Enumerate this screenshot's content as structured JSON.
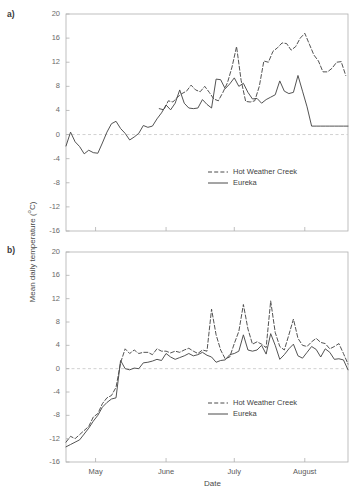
{
  "figure": {
    "panel_a_label": "a)",
    "panel_b_label": "b)",
    "y_axis_title_main": "Mean daily temperature (",
    "y_axis_title_sup": "o",
    "y_axis_title_tail": "C)",
    "y_axis_title_full": "Mean daily temperature (oC)",
    "x_axis_title": "Date"
  },
  "legend": {
    "series_1": "Hot Weather Creek",
    "series_2": "Eureka"
  },
  "colors": {
    "line": "#4a4a4a",
    "axis": "#b0b0b0",
    "zero_line": "#cccccc",
    "text": "#4a4a4a",
    "tick_text": "#6a6a6a",
    "background": "#ffffff"
  },
  "chart_data": [
    {
      "id": "panel-a",
      "type": "line",
      "title": "a)",
      "xlabel": "Date",
      "ylabel": "Mean daily temperature (oC)",
      "ylim": [
        -16,
        20
      ],
      "yticks": [
        20,
        16,
        12,
        8,
        4,
        0,
        -4,
        -8,
        -12,
        -16
      ],
      "ytick_labels": [
        "20",
        "16",
        "12",
        "8",
        "4",
        "0",
        "-4",
        "-8",
        "-12",
        "-16"
      ],
      "xlim": [
        0,
        124
      ],
      "xticks": [
        13,
        44,
        74,
        105
      ],
      "xtick_labels": [
        "",
        "",
        "",
        ""
      ],
      "grid": false,
      "zero_reference_line": 0,
      "legend_position": "lower-right",
      "series": [
        {
          "name": "Hot Weather Creek",
          "style": "dashed",
          "x": [
            41,
            43,
            45,
            47,
            49,
            51,
            53,
            55,
            57,
            59,
            61,
            63,
            65,
            67,
            69,
            71,
            73,
            75,
            77,
            79,
            81,
            83,
            85,
            87,
            89,
            91,
            93,
            95,
            97,
            99,
            101,
            103,
            105,
            107,
            109,
            111,
            113,
            115,
            117,
            119,
            121,
            123
          ],
          "values": [
            4.3,
            4.1,
            5.6,
            5.4,
            6.2,
            6.8,
            7.2,
            8.2,
            7.4,
            7.1,
            8.0,
            7.0,
            5.9,
            5.6,
            7.0,
            8.6,
            11.2,
            14.6,
            9.0,
            5.5,
            5.4,
            5.6,
            8.0,
            12.2,
            12.0,
            13.8,
            14.4,
            15.2,
            15.1,
            14.0,
            14.6,
            16.0,
            16.8,
            15.0,
            13.2,
            12.2,
            10.4,
            10.4,
            11.0,
            12.0,
            12.1,
            9.8,
            3.4
          ]
        },
        {
          "name": "Eureka",
          "style": "solid",
          "x": [
            0,
            2,
            4,
            6,
            8,
            10,
            12,
            14,
            16,
            18,
            20,
            22,
            24,
            26,
            28,
            30,
            32,
            34,
            36,
            38,
            40,
            42,
            44,
            46,
            48,
            50,
            52,
            54,
            56,
            58,
            60,
            62,
            64,
            66,
            68,
            70,
            72,
            74,
            76,
            78,
            80,
            82,
            84,
            86,
            88,
            90,
            92,
            94,
            96,
            98,
            100,
            102,
            104,
            106,
            108,
            110,
            112,
            114,
            116,
            118,
            120,
            122,
            124
          ],
          "values": [
            -1.9,
            0.4,
            -1.2,
            -2.0,
            -3.2,
            -2.6,
            -3.0,
            -3.1,
            -1.4,
            0.4,
            1.8,
            2.2,
            1.0,
            0.2,
            -0.9,
            -0.4,
            0.2,
            1.5,
            1.2,
            1.4,
            2.6,
            3.6,
            4.9,
            4.1,
            5.2,
            7.4,
            5.2,
            4.4,
            4.3,
            4.4,
            5.8,
            5.0,
            4.4,
            9.2,
            9.1,
            7.6,
            8.4,
            9.4,
            8.0,
            8.5,
            7.0,
            5.9,
            6.0,
            5.2,
            5.8,
            6.2,
            6.6,
            8.9,
            7.2,
            6.8,
            7.0,
            9.8,
            7.2,
            4.6,
            1.4,
            1.4,
            1.4,
            1.4,
            1.4,
            1.4,
            1.4,
            1.4,
            1.4
          ]
        }
      ]
    },
    {
      "id": "panel-b",
      "type": "line",
      "title": "b)",
      "xlabel": "Date",
      "ylabel": "Mean daily temperature (oC)",
      "ylim": [
        -16,
        20
      ],
      "yticks": [
        20,
        16,
        12,
        8,
        4,
        0,
        -4,
        -8,
        -12,
        -16
      ],
      "ytick_labels": [
        "20",
        "16",
        "12",
        "8",
        "4",
        "0",
        "-4",
        "-8",
        "-12",
        "-16"
      ],
      "xlim": [
        0,
        124
      ],
      "xticks": [
        13,
        44,
        74,
        105
      ],
      "xtick_labels": [
        "May",
        "June",
        "July",
        "August"
      ],
      "grid": false,
      "zero_reference_line": 0,
      "legend_position": "lower-right",
      "series": [
        {
          "name": "Hot Weather Creek",
          "style": "dashed",
          "x": [
            0,
            2,
            4,
            6,
            8,
            10,
            12,
            14,
            16,
            18,
            20,
            22,
            24,
            26,
            28,
            30,
            32,
            34,
            36,
            38,
            40,
            42,
            44,
            46,
            48,
            50,
            52,
            54,
            56,
            58,
            60,
            62,
            64,
            66,
            68,
            70,
            72,
            74,
            76,
            78,
            80,
            82,
            84,
            86,
            88,
            90,
            92,
            94,
            96,
            98,
            100,
            102,
            104,
            106,
            108,
            110,
            112,
            114,
            116,
            118,
            120,
            122,
            124
          ],
          "values": [
            -12.6,
            -11.6,
            -12.0,
            -11.3,
            -10.6,
            -9.9,
            -8.3,
            -7.7,
            -6.0,
            -5.0,
            -4.6,
            -3.2,
            1.0,
            3.4,
            2.6,
            3.2,
            2.6,
            2.8,
            2.8,
            2.4,
            3.4,
            3.0,
            3.0,
            2.7,
            3.0,
            2.8,
            3.2,
            3.5,
            3.0,
            2.6,
            3.2,
            3.0,
            10.2,
            5.8,
            3.2,
            1.7,
            2.0,
            4.3,
            6.4,
            11.0,
            6.8,
            4.2,
            4.6,
            4.2,
            3.6,
            11.6,
            6.2,
            3.8,
            3.2,
            5.8,
            8.5,
            5.2,
            4.0,
            3.8,
            4.6,
            5.2,
            4.5,
            4.3,
            3.4,
            3.8,
            4.3,
            2.6,
            0.8
          ]
        },
        {
          "name": "Eureka",
          "style": "solid",
          "x": [
            0,
            2,
            4,
            6,
            8,
            10,
            12,
            14,
            16,
            18,
            20,
            22,
            24,
            26,
            28,
            30,
            32,
            34,
            36,
            38,
            40,
            42,
            44,
            46,
            48,
            50,
            52,
            54,
            56,
            58,
            60,
            62,
            64,
            66,
            68,
            70,
            72,
            74,
            76,
            78,
            80,
            82,
            84,
            86,
            88,
            90,
            92,
            94,
            96,
            98,
            100,
            102,
            104,
            106,
            108,
            110,
            112,
            114,
            116,
            118,
            120,
            122,
            124
          ],
          "values": [
            -13.4,
            -13.0,
            -12.6,
            -12.2,
            -11.2,
            -10.2,
            -9.0,
            -8.0,
            -6.6,
            -5.8,
            -5.2,
            -5.0,
            1.4,
            0.0,
            -0.2,
            0.1,
            0.0,
            1.0,
            1.1,
            1.3,
            1.6,
            1.4,
            2.6,
            2.0,
            1.6,
            1.9,
            2.2,
            2.6,
            2.2,
            2.4,
            2.8,
            2.3,
            2.0,
            1.1,
            1.4,
            1.5,
            2.4,
            2.6,
            3.0,
            5.8,
            3.2,
            3.0,
            3.2,
            4.0,
            2.5,
            6.0,
            4.0,
            1.6,
            2.4,
            3.4,
            4.2,
            2.2,
            1.8,
            2.8,
            3.8,
            3.3,
            2.0,
            3.4,
            2.8,
            1.6,
            1.7,
            1.5,
            -0.2
          ]
        }
      ]
    }
  ]
}
